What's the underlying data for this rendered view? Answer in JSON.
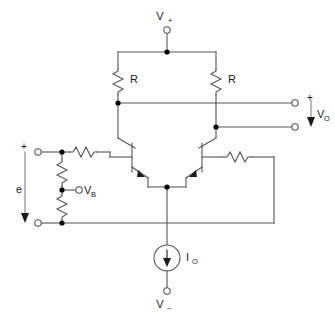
{
  "diagram": {
    "stroke_color": "#555555",
    "node_color": "#000000",
    "background": "#ffffff"
  },
  "labels": {
    "supply_positive": "V",
    "supply_positive_sign": "+",
    "supply_negative": "V",
    "supply_negative_sign": "–",
    "resistor_left": "R",
    "resistor_right": "R",
    "output_voltage": "V",
    "output_voltage_sub": "O",
    "output_polarity_plus": "+",
    "input_signal": "e",
    "input_polarity_plus": "+",
    "bias_voltage": "V",
    "bias_voltage_sub": "B",
    "current_source": "I",
    "current_source_sub": "O"
  },
  "components": {
    "transistors": [
      {
        "name": "q1-left-npn",
        "type": "NPN",
        "orientation": "base-left"
      },
      {
        "name": "q2-right-npn",
        "type": "NPN",
        "orientation": "base-right"
      }
    ],
    "resistors": [
      {
        "name": "rc-left",
        "label": "R",
        "orientation": "vertical"
      },
      {
        "name": "rc-right",
        "label": "R",
        "orientation": "vertical"
      },
      {
        "name": "rb-input-left",
        "label": "",
        "orientation": "horizontal"
      },
      {
        "name": "rb-input-right",
        "label": "",
        "orientation": "horizontal"
      },
      {
        "name": "rdiv-upper",
        "label": "",
        "orientation": "vertical"
      },
      {
        "name": "rdiv-lower",
        "label": "",
        "orientation": "vertical"
      }
    ],
    "terminals": [
      {
        "name": "terminal-vplus"
      },
      {
        "name": "terminal-vminus"
      },
      {
        "name": "terminal-vout-plus"
      },
      {
        "name": "terminal-vout-minus"
      },
      {
        "name": "terminal-vb"
      },
      {
        "name": "terminal-input-plus"
      },
      {
        "name": "terminal-input-minus"
      }
    ],
    "sources": [
      {
        "name": "current-source-io",
        "label": "I",
        "sub": "O",
        "direction": "down"
      }
    ]
  }
}
